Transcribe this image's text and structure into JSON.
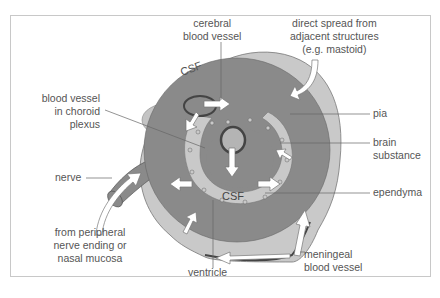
{
  "diagram": {
    "type": "anatomical cross-section",
    "labels": {
      "cerebral_vessel_1": "cerebral",
      "cerebral_vessel_2": "blood vessel",
      "direct_spread_1": "direct spread from",
      "direct_spread_2": "adjacent structures",
      "direct_spread_3": "(e.g. mastoid)",
      "choroid_1": "blood vessel",
      "choroid_2": "in choroid",
      "choroid_3": "plexus",
      "pia": "pia",
      "brain_1": "brain",
      "brain_2": "substance",
      "nerve": "nerve",
      "ependyma": "ependyma",
      "peripheral_1": "from peripheral",
      "peripheral_2": "nerve ending or",
      "peripheral_3": "nasal mucosa",
      "ventricle": "ventricle",
      "meningeal_1": "meningeal",
      "meningeal_2": "blood vessel",
      "csf_outer": "CSF",
      "csf_inner": "CSF"
    },
    "colors": {
      "csf_light": "#c9c9c9",
      "brain_dark": "#8a8a8a",
      "ventricle_mid": "#b4b4b4",
      "arrow_fill": "#ffffff",
      "vessel_dark": "#505050",
      "text": "#555555",
      "frame": "#c8c8c8"
    }
  }
}
